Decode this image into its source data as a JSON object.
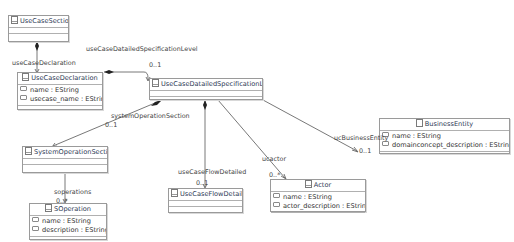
{
  "diagram": {
    "type": "uml-class-diagram",
    "classes": [
      {
        "id": "UseCaseSection",
        "name": "UseCaseSection",
        "attributes": []
      },
      {
        "id": "UseCaseDeclaration",
        "name": "UseCaseDeclaration",
        "attributes": [
          "name : EString",
          "usecase_name : EString"
        ]
      },
      {
        "id": "UseCaseDatailedSpecificationLevel",
        "name": "UseCaseDatailedSpecificationLevel",
        "attributes": []
      },
      {
        "id": "SystemOperationSection",
        "name": "SystemOperationSection",
        "attributes": []
      },
      {
        "id": "SOperation",
        "name": "SOperation",
        "attributes": [
          "name : EString",
          "description : EString"
        ]
      },
      {
        "id": "UseCaseFlowDetailed",
        "name": "UseCaseFlowDetailed",
        "attributes": []
      },
      {
        "id": "Actor",
        "name": "Actor",
        "attributes": [
          "name : EString",
          "actor_description : EString"
        ]
      },
      {
        "id": "BusinessEntity",
        "name": "BusinessEntity",
        "attributes": [
          "name : EString",
          "domainconcept_description : EString"
        ]
      }
    ],
    "references": [
      {
        "from": "UseCaseSection",
        "to": "UseCaseDeclaration",
        "name": "useCaseDeclaration",
        "multiplicity": "",
        "containment": true
      },
      {
        "from": "UseCaseDeclaration",
        "to": "UseCaseDatailedSpecificationLevel",
        "name": "useCaseDatailedSpecificationLevel",
        "multiplicity": "0..1",
        "containment": true
      },
      {
        "from": "UseCaseDatailedSpecificationLevel",
        "to": "SystemOperationSection",
        "name": "systemOperationSection",
        "multiplicity": "0..1",
        "containment": true
      },
      {
        "from": "SystemOperationSection",
        "to": "SOperation",
        "name": "soperations",
        "multiplicity": "0..*",
        "containment": true
      },
      {
        "from": "UseCaseDatailedSpecificationLevel",
        "to": "UseCaseFlowDetailed",
        "name": "useCaseFlowDetailed",
        "multiplicity": "0..1",
        "containment": true
      },
      {
        "from": "UseCaseDatailedSpecificationLevel",
        "to": "Actor",
        "name": "ucactor",
        "multiplicity": "0..*",
        "containment": false
      },
      {
        "from": "UseCaseDatailedSpecificationLevel",
        "to": "BusinessEntity",
        "name": "ucBusinessEntity",
        "multiplicity": "0..1",
        "containment": false
      }
    ]
  },
  "classes": {
    "usecase_section": {
      "name": "UseCaseSection"
    },
    "usecase_declaration": {
      "name": "UseCaseDeclaration",
      "attr0": "name : EString",
      "attr1": "usecase_name : EString"
    },
    "detailed_spec": {
      "name": "UseCaseDatailedSpecificationLevel"
    },
    "sysop_section": {
      "name": "SystemOperationSection"
    },
    "soperation": {
      "name": "SOperation",
      "attr0": "name : EString",
      "attr1": "description : EString"
    },
    "flow_detailed": {
      "name": "UseCaseFlowDetailed"
    },
    "actor": {
      "name": "Actor",
      "attr0": "name : EString",
      "attr1": "actor_description : EString"
    },
    "business_entity": {
      "name": "BusinessEntity",
      "attr0": "name : EString",
      "attr1": "domainconcept_description : EString"
    }
  },
  "labels": {
    "use_case_declaration": "useCaseDeclaration",
    "use_case_detailed_spec": "useCaseDatailedSpecificationLevel",
    "use_case_detailed_spec_mult": "0..1",
    "system_operation_section": "systemOperationSection",
    "system_operation_section_mult": "0..1",
    "soperations": "soperations",
    "soperations_mult": "0..*",
    "use_case_flow_detailed": "useCaseFlowDetailed",
    "use_case_flow_detailed_mult": "0..1",
    "ucactor": "ucactor",
    "ucactor_mult": "0..*",
    "uc_business_entity": "ucBusinessEntity",
    "uc_business_entity_mult": "0..1"
  },
  "colors": {
    "edge": "#555555",
    "border": "#9a9a9a",
    "header_text": "#2e3a55"
  }
}
